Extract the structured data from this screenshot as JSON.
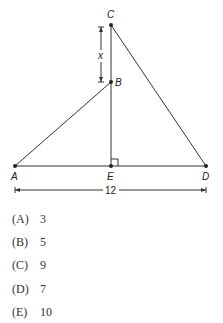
{
  "figure": {
    "points": {
      "A": {
        "label": "A",
        "x": 15,
        "y": 166
      },
      "B": {
        "label": "B",
        "x": 111,
        "y": 82
      },
      "C": {
        "label": "C",
        "x": 111,
        "y": 25
      },
      "D": {
        "label": "D",
        "x": 206,
        "y": 166
      },
      "E": {
        "label": "E",
        "x": 111,
        "y": 166
      }
    },
    "segment_label_x": "x",
    "base_length_label": "12",
    "right_angle_at": "E"
  },
  "choices": [
    {
      "letter": "(A)",
      "value": "3"
    },
    {
      "letter": "(B)",
      "value": "5"
    },
    {
      "letter": "(C)",
      "value": "9"
    },
    {
      "letter": "(D)",
      "value": "7"
    },
    {
      "letter": "(E)",
      "value": "10"
    }
  ]
}
